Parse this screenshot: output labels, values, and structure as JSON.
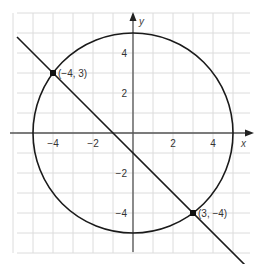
{
  "figure": {
    "axes": {
      "x_label": "x",
      "y_label": "y",
      "x_ticks": [
        {
          "v": -4,
          "label": "−4"
        },
        {
          "v": -2,
          "label": "−2"
        },
        {
          "v": 2,
          "label": "2"
        },
        {
          "v": 4,
          "label": "4"
        }
      ],
      "y_ticks": [
        {
          "v": 4,
          "label": "4"
        },
        {
          "v": 2,
          "label": "2"
        },
        {
          "v": -2,
          "label": "−2"
        },
        {
          "v": -4,
          "label": "−4"
        }
      ]
    },
    "circle": {
      "cx": 0,
      "cy": 0,
      "r": 5
    },
    "line": {
      "from": [
        -5.8,
        4.8
      ],
      "to": [
        5.6,
        -6.6
      ]
    },
    "points": [
      {
        "x": -4,
        "y": 3,
        "label": "(−4, 3)"
      },
      {
        "x": 3,
        "y": -4,
        "label": "(3, −4)"
      }
    ],
    "colors": {
      "grid": "#dcdcdc",
      "axis": "#555555",
      "curve": "#1a1a1a"
    }
  }
}
